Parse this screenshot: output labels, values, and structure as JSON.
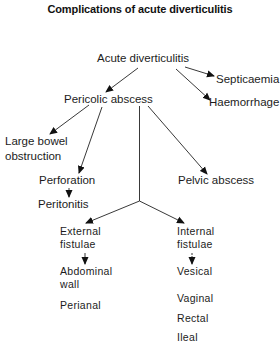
{
  "title": "Complications of acute diverticulitis",
  "nodes": {
    "acute": "Acute diverticulitis",
    "septicaemia": "Septicaemia",
    "haemorrhage": "Haemorrhage",
    "pericolic": "Pericolic abscess",
    "lbo_line1": "Large bowel",
    "lbo_line2": "obstruction",
    "perforation": "Perforation",
    "peritonitis": "Peritonitis",
    "pelvic": "Pelvic abscess",
    "external_line1": "External",
    "external_line2": "fistulae",
    "internal_line1": "Internal",
    "internal_line2": "fistulae",
    "abdominal_line1": "Abdominal",
    "abdominal_line2": "wall",
    "perianal": "Perianal",
    "vesical": "Vesical",
    "vaginal": "Vaginal",
    "rectal": "Rectal",
    "ileal": "Ileal"
  },
  "edges": [
    {
      "from": "Acute diverticulitis",
      "to": "Septicaemia"
    },
    {
      "from": "Acute diverticulitis",
      "to": "Haemorrhage"
    },
    {
      "from": "Acute diverticulitis",
      "to": "Pericolic abscess"
    },
    {
      "from": "Pericolic abscess",
      "to": "Large bowel obstruction"
    },
    {
      "from": "Pericolic abscess",
      "to": "Perforation"
    },
    {
      "from": "Pericolic abscess",
      "to": "Pelvic abscess"
    },
    {
      "from": "Pericolic abscess",
      "to": "External fistulae"
    },
    {
      "from": "Pericolic abscess",
      "to": "Internal fistulae"
    },
    {
      "from": "Perforation",
      "to": "Peritonitis"
    },
    {
      "from": "External fistulae",
      "to": "Abdominal wall"
    },
    {
      "from": "Internal fistulae",
      "to": "Vesical"
    }
  ]
}
